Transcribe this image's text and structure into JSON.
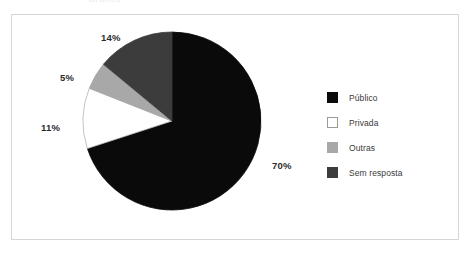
{
  "frame": {
    "border_color": "#d6d6d6",
    "background": "#ffffff"
  },
  "artifact": {
    "text": "Gráfico"
  },
  "chart_data": {
    "type": "pie",
    "title": "",
    "subtitle": "",
    "xlabel": "",
    "ylabel": "",
    "grid": false,
    "legend_position": "right",
    "start_angle_deg": 0,
    "direction": "clockwise",
    "total": 100,
    "unit": "%",
    "categories": [
      "Público",
      "Privada",
      "Outras",
      "Sem resposta"
    ],
    "values": [
      70,
      11,
      5,
      14
    ],
    "colors": [
      "#0a0a0a",
      "#ffffff",
      "#a8a8a8",
      "#3c3c3c"
    ],
    "slices": [
      {
        "label": "Público",
        "value": 70,
        "value_text": "70%",
        "color": "#0a0a0a",
        "stroke": "#0a0a0a",
        "sweep_deg": 252,
        "start_deg": 0,
        "end_deg": 252
      },
      {
        "label": "Privada",
        "value": 11,
        "value_text": "11%",
        "color": "#ffffff",
        "stroke": "#b4b4b4",
        "sweep_deg": 39.6,
        "start_deg": 252,
        "end_deg": 291.6
      },
      {
        "label": "Outras",
        "value": 5,
        "value_text": "5%",
        "color": "#a8a8a8",
        "stroke": "#a8a8a8",
        "sweep_deg": 18,
        "start_deg": 291.6,
        "end_deg": 309.6
      },
      {
        "label": "Sem resposta",
        "value": 14,
        "value_text": "14%",
        "color": "#3c3c3c",
        "stroke": "#3c3c3c",
        "sweep_deg": 50.4,
        "start_deg": 309.6,
        "end_deg": 360
      }
    ],
    "data_labels": [
      {
        "text": "14%",
        "for": "Sem resposta"
      },
      {
        "text": "5%",
        "for": "Outras"
      },
      {
        "text": "11%",
        "for": "Privada"
      },
      {
        "text": "70%",
        "for": "Público"
      }
    ],
    "legend": [
      {
        "label": "Público",
        "color": "#0a0a0a",
        "border": "#0a0a0a"
      },
      {
        "label": "Privada",
        "color": "#ffffff",
        "border": "#9a9a9a"
      },
      {
        "label": "Outras",
        "color": "#a8a8a8",
        "border": "#a8a8a8"
      },
      {
        "label": "Sem resposta",
        "color": "#3c3c3c",
        "border": "#3c3c3c"
      }
    ]
  }
}
